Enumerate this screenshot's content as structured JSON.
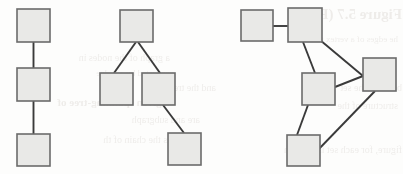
{
  "figure": {
    "width": 403,
    "height": 174,
    "background_color": "#fdfdfc",
    "node_style": {
      "shape": "square",
      "fill_color": "#e9e9e7",
      "border_color": "#6b6b6b",
      "border_width": 1.6,
      "size": 33
    },
    "edge_style": {
      "stroke_color": "#3a3a3a",
      "stroke_width": 1.9
    }
  },
  "graphs": [
    {
      "id": "graph-1",
      "name": "vertical-chain-graph",
      "node_count": 3,
      "edge_count": 2,
      "nodes": [
        {
          "id": "g1n1",
          "name": "node-top",
          "x": 17,
          "y": 9,
          "w": 33,
          "h": 33
        },
        {
          "id": "g1n2",
          "name": "node-middle",
          "x": 17,
          "y": 68,
          "w": 33,
          "h": 33
        },
        {
          "id": "g1n3",
          "name": "node-bottom",
          "x": 17,
          "y": 134,
          "w": 33,
          "h": 32
        }
      ],
      "edges": [
        {
          "id": "g1e1",
          "name": "edge-top-to-middle",
          "from": "g1n1",
          "to": "g1n2",
          "x1": 33.5,
          "y1": 42,
          "x2": 33.5,
          "y2": 68
        },
        {
          "id": "g1e2",
          "name": "edge-middle-to-bottom",
          "from": "g1n2",
          "to": "g1n3",
          "x1": 33.5,
          "y1": 101,
          "x2": 33.5,
          "y2": 134
        }
      ]
    },
    {
      "id": "graph-2",
      "name": "tree-graph",
      "node_count": 4,
      "edge_count": 3,
      "nodes": [
        {
          "id": "g2n1",
          "name": "node-root",
          "x": 120,
          "y": 10,
          "w": 33,
          "h": 32
        },
        {
          "id": "g2n2",
          "name": "node-left-child",
          "x": 100,
          "y": 73,
          "w": 33,
          "h": 32
        },
        {
          "id": "g2n3",
          "name": "node-right-child",
          "x": 142,
          "y": 73,
          "w": 33,
          "h": 32
        },
        {
          "id": "g2n4",
          "name": "node-leaf",
          "x": 168,
          "y": 133,
          "w": 33,
          "h": 32
        }
      ],
      "edges": [
        {
          "id": "g2e1",
          "name": "edge-root-to-left-child",
          "from": "g2n1",
          "to": "g2n2",
          "x1": 136,
          "y1": 42,
          "x2": 114,
          "y2": 73
        },
        {
          "id": "g2e2",
          "name": "edge-root-to-right-child",
          "from": "g2n1",
          "to": "g2n3",
          "x1": 138,
          "y1": 42,
          "x2": 160,
          "y2": 73
        },
        {
          "id": "g2e3",
          "name": "edge-right-child-to-leaf",
          "from": "g2n3",
          "to": "g2n4",
          "x1": 163,
          "y1": 105,
          "x2": 184,
          "y2": 133
        }
      ]
    },
    {
      "id": "graph-3",
      "name": "cyclic-graph",
      "node_count": 5,
      "edge_count": 6,
      "nodes": [
        {
          "id": "g3n1",
          "name": "node-top-left",
          "x": 241,
          "y": 10,
          "w": 32,
          "h": 31
        },
        {
          "id": "g3n2",
          "name": "node-top-middle",
          "x": 288,
          "y": 8,
          "w": 34,
          "h": 34
        },
        {
          "id": "g3n3",
          "name": "node-right",
          "x": 363,
          "y": 58,
          "w": 33,
          "h": 33
        },
        {
          "id": "g3n4",
          "name": "node-center",
          "x": 302,
          "y": 73,
          "w": 33,
          "h": 32
        },
        {
          "id": "g3n5",
          "name": "node-bottom",
          "x": 287,
          "y": 135,
          "w": 33,
          "h": 31
        }
      ],
      "edges": [
        {
          "id": "g3e1",
          "name": "edge-top-left-to-top-middle",
          "from": "g3n1",
          "to": "g3n2",
          "x1": 273,
          "y1": 26,
          "x2": 288,
          "y2": 26
        },
        {
          "id": "g3e2",
          "name": "edge-top-middle-to-right",
          "from": "g3n2",
          "to": "g3n3",
          "x1": 320,
          "y1": 40,
          "x2": 363,
          "y2": 76
        },
        {
          "id": "g3e3",
          "name": "edge-top-middle-to-center",
          "from": "g3n2",
          "to": "g3n4",
          "x1": 303,
          "y1": 42,
          "x2": 315,
          "y2": 73
        },
        {
          "id": "g3e4",
          "name": "edge-center-to-right",
          "from": "g3n4",
          "to": "g3n3",
          "x1": 335,
          "y1": 87,
          "x2": 363,
          "y2": 76
        },
        {
          "id": "g3e5",
          "name": "edge-center-to-bottom",
          "from": "g3n4",
          "to": "g3n5",
          "x1": 308,
          "y1": 105,
          "x2": 297,
          "y2": 135
        },
        {
          "id": "g3e6",
          "name": "edge-right-to-bottom",
          "from": "g3n3",
          "to": "g3n5",
          "x1": 375,
          "y1": 91,
          "x2": 316,
          "y2": 152
        }
      ]
    }
  ],
  "background_bleed": {
    "note": "Faint mirrored text showing through from the reverse side of the scanned page",
    "lines": [
      {
        "text": "Figure 5.7  (PS)",
        "x": 232,
        "y": 6,
        "size": 15,
        "weight": "bold"
      },
      {
        "text": "he edges of a vertex tree",
        "x": 228,
        "y": 34,
        "size": 9,
        "weight": "normal"
      },
      {
        "text": "a graph of the nodes in",
        "x": 0,
        "y": 52,
        "size": 10,
        "weight": "normal"
      },
      {
        "text": "connected by an edge",
        "x": 4,
        "y": 68,
        "size": 9,
        "weight": "normal"
      },
      {
        "text": "and the tree",
        "x": 46,
        "y": 82,
        "size": 10,
        "weight": "normal"
      },
      {
        "text": "between the set",
        "x": 232,
        "y": 82,
        "size": 10,
        "weight": "normal"
      },
      {
        "text": "a given spanning-tree of",
        "x": 0,
        "y": 96,
        "size": 11,
        "weight": "bold"
      },
      {
        "text": "structure of the",
        "x": 228,
        "y": 100,
        "size": 10,
        "weight": "normal"
      },
      {
        "text": "are and subgraph",
        "x": 30,
        "y": 114,
        "size": 10,
        "weight": "normal"
      },
      {
        "text": "is the chain of th",
        "x": 0,
        "y": 134,
        "size": 10,
        "weight": "normal"
      },
      {
        "text": "figure, for each set is  show th",
        "x": 232,
        "y": 144,
        "size": 10,
        "weight": "normal"
      }
    ]
  }
}
